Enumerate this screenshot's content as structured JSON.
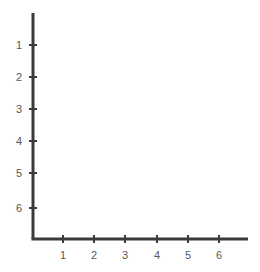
{
  "chart_data": {
    "type": "scatter",
    "title": "",
    "subtitle": "",
    "xlabel": "",
    "ylabel": "",
    "grid": false,
    "legend": null,
    "legend_position": "none",
    "series": [],
    "annotations": [],
    "x": [],
    "values": [],
    "xlim": [
      0,
      6.9
    ],
    "ylim": [
      6.9,
      0
    ],
    "y_axis_direction": "downward",
    "x_tick_labels": [
      "1",
      "2",
      "3",
      "4",
      "5",
      "6"
    ],
    "y_tick_labels": [
      "1",
      "2",
      "3",
      "4",
      "5",
      "6"
    ],
    "x_ticks": [
      {
        "label": "1",
        "px": 63
      },
      {
        "label": "2",
        "px": 94
      },
      {
        "label": "3",
        "px": 125
      },
      {
        "label": "4",
        "px": 157
      },
      {
        "label": "5",
        "px": 188
      },
      {
        "label": "6",
        "px": 219
      }
    ],
    "y_ticks": [
      {
        "label": "1",
        "px": 45
      },
      {
        "label": "2",
        "px": 77
      },
      {
        "label": "3",
        "px": 109
      },
      {
        "label": "4",
        "px": 141
      },
      {
        "label": "5",
        "px": 173
      },
      {
        "label": "6",
        "px": 208
      }
    ],
    "colors": {
      "axis": "#3a3a3a",
      "tick": "#3a3a3a",
      "label": "#585858",
      "background": "#ffffff"
    },
    "geometry": {
      "width": 260,
      "height": 272,
      "origin_x": 33,
      "origin_y": 239,
      "y_axis_top": 13,
      "x_axis_right": 248,
      "y_tick_half_width": 4,
      "x_tick_half_height": 4,
      "y_label_x": 22,
      "x_label_y": 255
    }
  }
}
